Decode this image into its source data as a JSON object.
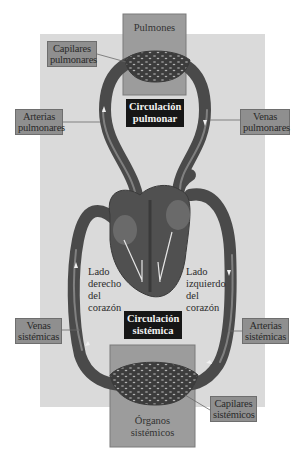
{
  "diagram": {
    "title_pulmonary": [
      "Circulación",
      "pulmonar"
    ],
    "title_systemic": [
      "Circulación",
      "sistémica"
    ],
    "organs": {
      "lungs": "Pulmones",
      "systemic_organs": [
        "Órganos",
        "sistémicos"
      ]
    },
    "labels": {
      "pulmonary_capillaries": [
        "Capilares",
        "pulmonares"
      ],
      "pulmonary_arteries": [
        "Arterias",
        "pulmonares"
      ],
      "pulmonary_veins": [
        "Venas",
        "pulmonares"
      ],
      "systemic_veins": [
        "Venas",
        "sistémicas"
      ],
      "systemic_arteries": [
        "Arterias",
        "sistémicas"
      ],
      "systemic_capillaries": [
        "Capilares",
        "sistémicos"
      ]
    },
    "heart_sides": {
      "right": [
        "Lado",
        "derecho",
        "del",
        "corazón"
      ],
      "left": [
        "Lado",
        "izquierdo",
        "del",
        "corazón"
      ]
    },
    "colors": {
      "background_panel": "#d9d9d9",
      "vessel": "#555555",
      "vessel_highlight": "#8a8a8a",
      "label_box": "#8f8f8f",
      "organ_box": "#9a9a9a",
      "title_box": "#161616"
    }
  }
}
